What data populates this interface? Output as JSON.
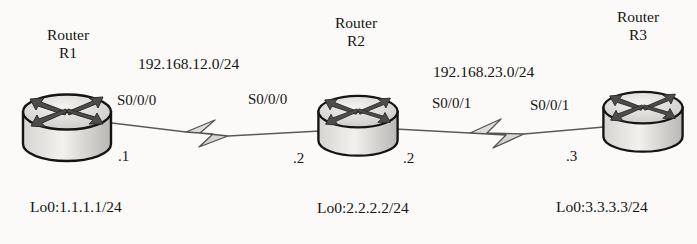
{
  "diagram": {
    "background_color": "#fbfaf8",
    "ink_color": "#151515"
  },
  "routers": [
    {
      "id": "R1",
      "name_line1": "Router",
      "name_line2": "R1",
      "icon": "router-icon",
      "loopback": "Lo0:1.1.1.1/24",
      "interfaces": [
        {
          "label": "S0/0/0",
          "host_octet": ".1"
        }
      ]
    },
    {
      "id": "R2",
      "name_line1": "Router",
      "name_line2": "R2",
      "icon": "router-icon",
      "loopback": "Lo0:2.2.2.2/24",
      "interfaces": [
        {
          "label": "S0/0/0",
          "host_octet": ".2"
        },
        {
          "label": "S0/0/1",
          "host_octet": ".2"
        }
      ]
    },
    {
      "id": "R3",
      "name_line1": "Router",
      "name_line2": "R3",
      "icon": "router-icon",
      "loopback": "Lo0:3.3.3.3/24",
      "interfaces": [
        {
          "label": "S0/0/1",
          "host_octet": ".3"
        }
      ]
    }
  ],
  "links": [
    {
      "id": "link-r1-r2",
      "network": "192.168.12.0/24",
      "media": "serial-wan",
      "endpoint_left": {
        "router": "R1",
        "interface": "S0/0/0",
        "host_octet": ".1"
      },
      "endpoint_right": {
        "router": "R2",
        "interface": "S0/0/0",
        "host_octet": ".2"
      }
    },
    {
      "id": "link-r2-r3",
      "network": "192.168.23.0/24",
      "media": "serial-wan",
      "endpoint_left": {
        "router": "R2",
        "interface": "S0/0/1",
        "host_octet": ".2"
      },
      "endpoint_right": {
        "router": "R3",
        "interface": "S0/0/1",
        "host_octet": ".3"
      }
    }
  ]
}
